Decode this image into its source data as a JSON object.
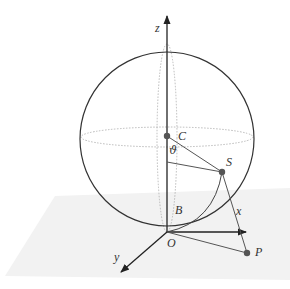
{
  "diagram": {
    "title": "",
    "labels": {
      "z_axis": "z",
      "x_axis": "x",
      "y_axis": "y",
      "center": "C",
      "point_s": "S",
      "point_p": "P",
      "point_b": "B",
      "origin": "O",
      "angle": "ϑ"
    },
    "points": [
      "C",
      "S",
      "P",
      "O"
    ],
    "segments": [
      {
        "from": "C",
        "to": "S"
      },
      {
        "from": "S",
        "to": "P"
      },
      {
        "from": "O",
        "to": "P"
      }
    ],
    "axes": [
      "x",
      "y",
      "z"
    ],
    "colors": {
      "stroke": "#333333",
      "light_stroke": "#999999",
      "dotted": "#aaaaaa",
      "ground": "#f1f1f1",
      "point": "#555555"
    }
  }
}
